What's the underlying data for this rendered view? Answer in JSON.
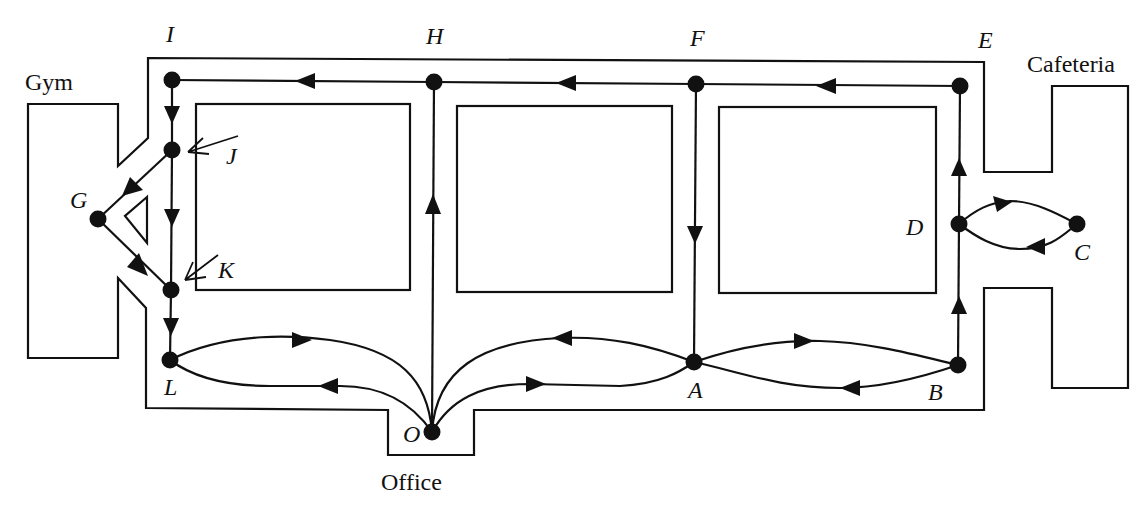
{
  "figure": {
    "type": "directed-graph-floor-plan",
    "rooms": {
      "gym": "Gym",
      "cafeteria": "Cafeteria",
      "office": "Office"
    },
    "nodes": [
      {
        "id": "I",
        "label": "I"
      },
      {
        "id": "H",
        "label": "H"
      },
      {
        "id": "F",
        "label": "F"
      },
      {
        "id": "E",
        "label": "E"
      },
      {
        "id": "J",
        "label": "J"
      },
      {
        "id": "G",
        "label": "G"
      },
      {
        "id": "K",
        "label": "K"
      },
      {
        "id": "L",
        "label": "L"
      },
      {
        "id": "O",
        "label": "O"
      },
      {
        "id": "A",
        "label": "A"
      },
      {
        "id": "B",
        "label": "B"
      },
      {
        "id": "D",
        "label": "D"
      },
      {
        "id": "C",
        "label": "C"
      }
    ],
    "edges": [
      {
        "from": "E",
        "to": "F"
      },
      {
        "from": "F",
        "to": "H"
      },
      {
        "from": "H",
        "to": "I"
      },
      {
        "from": "I",
        "to": "J"
      },
      {
        "from": "J",
        "to": "K"
      },
      {
        "from": "J",
        "to": "G"
      },
      {
        "from": "G",
        "to": "K"
      },
      {
        "from": "K",
        "to": "L"
      },
      {
        "from": "L",
        "to": "O"
      },
      {
        "from": "O",
        "to": "L"
      },
      {
        "from": "O",
        "to": "H"
      },
      {
        "from": "O",
        "to": "A"
      },
      {
        "from": "A",
        "to": "O"
      },
      {
        "from": "F",
        "to": "A"
      },
      {
        "from": "A",
        "to": "B"
      },
      {
        "from": "B",
        "to": "A"
      },
      {
        "from": "B",
        "to": "D"
      },
      {
        "from": "D",
        "to": "E"
      },
      {
        "from": "D",
        "to": "C"
      },
      {
        "from": "C",
        "to": "D"
      }
    ]
  }
}
